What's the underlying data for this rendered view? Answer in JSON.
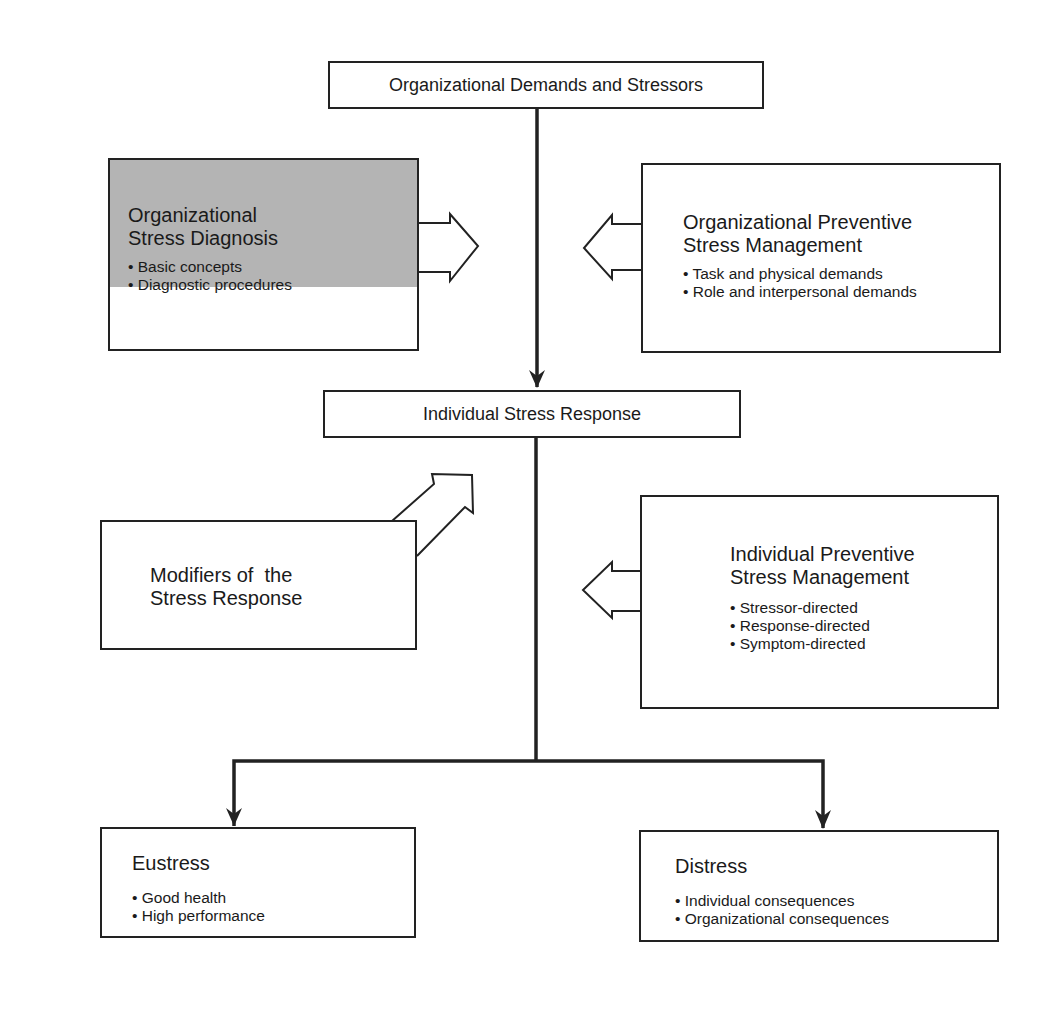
{
  "diagram": {
    "top_node": {
      "label": "Organizational Demands and Stressors"
    },
    "org_diagnosis": {
      "title_lines": [
        "Organizational",
        "Stress Diagnosis"
      ],
      "bullets": [
        "Basic concepts",
        "Diagnostic procedures"
      ],
      "fill_color": "#b4b4b4"
    },
    "org_preventive": {
      "title_lines": [
        "Organizational Preventive",
        "Stress Management"
      ],
      "bullets": [
        "Task and physical demands",
        "Role and interpersonal demands"
      ]
    },
    "response_node": {
      "label": "Individual Stress Response"
    },
    "modifiers": {
      "title_lines": [
        "Modifiers of  the",
        "Stress Response"
      ]
    },
    "ind_preventive": {
      "title_lines": [
        "Individual Preventive",
        "Stress Management"
      ],
      "bullets": [
        "Stressor-directed",
        "Response-directed",
        "Symptom-directed"
      ]
    },
    "eustress": {
      "title": "Eustress",
      "bullets": [
        "Good health",
        "High performance"
      ]
    },
    "distress": {
      "title": "Distress",
      "bullets": [
        "Individual consequences",
        "Organizational consequences"
      ]
    },
    "colors": {
      "line": "#222222",
      "shade": "#b4b4b4"
    }
  }
}
